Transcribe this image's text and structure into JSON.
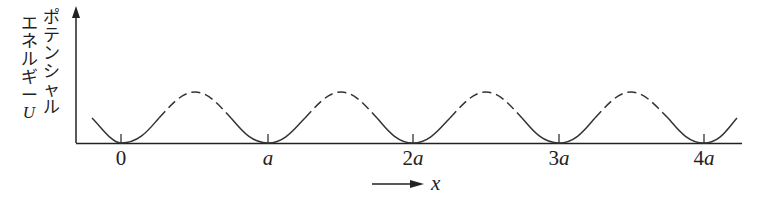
{
  "diagram": {
    "y_label_col1": [
      "エ",
      "ネ",
      "ル",
      "ギ",
      "ー",
      "U"
    ],
    "y_label_col2": [
      "ポ",
      "テ",
      "ン",
      "シ",
      "ャ",
      "ル"
    ],
    "y_label": "ポテンシャルエネルギーU",
    "x_label": "x",
    "ticks": [
      {
        "num": "0",
        "sym": ""
      },
      {
        "num": "",
        "sym": "a"
      },
      {
        "num": "2",
        "sym": "a"
      },
      {
        "num": "3",
        "sym": "a"
      },
      {
        "num": "4",
        "sym": "a"
      }
    ],
    "line_color": "#333333",
    "curve": "periodic cosine-like potential, minima at lattice points 0,a,2a,3a,4a; lower halves solid, upper halves dashed"
  }
}
